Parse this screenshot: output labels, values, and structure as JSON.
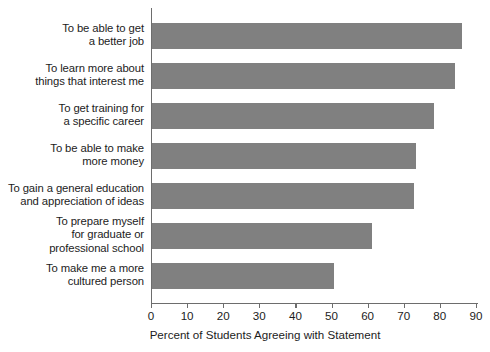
{
  "chart_data": {
    "type": "bar",
    "orientation": "horizontal",
    "title": "",
    "xlabel": "Percent of Students Agreeing with Statement",
    "ylabel": "",
    "xlim": [
      0,
      90
    ],
    "xticks": [
      0,
      10,
      20,
      30,
      40,
      50,
      60,
      70,
      80,
      90
    ],
    "grid": false,
    "legend": null,
    "bar_color": "#808080",
    "axis_color": "#6d6d6d",
    "categories": [
      "To be able to get\na better job",
      "To learn more about\nthings that interest me",
      "To get training for\na specific career",
      "To be able to make\nmore money",
      "To gain a general education\nand appreciation of ideas",
      "To prepare myself\nfor graduate or\nprofessional school",
      "To make me a more\ncultured person"
    ],
    "values": [
      86,
      84,
      78,
      73,
      72.5,
      61,
      50.5
    ]
  }
}
